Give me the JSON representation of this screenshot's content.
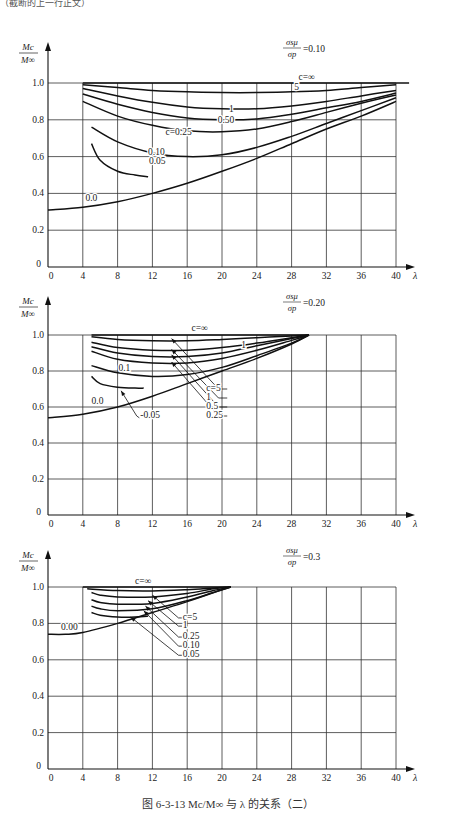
{
  "header_fragment": "（截断的上一行正文）",
  "caption": "图 6-3-13   Mc/M∞ 与 λ 的关系（二）",
  "chart_data": [
    {
      "type": "line",
      "title": "σs μ / σp = 0.10",
      "param_label": "σsμ/σp",
      "param_value": "=0.10",
      "xlabel": "λ",
      "ylabel": "Mc/M∞",
      "xlim": [
        0,
        40
      ],
      "ylim": [
        0,
        1.0
      ],
      "xticks": [
        0,
        4,
        8,
        12,
        16,
        20,
        24,
        28,
        32,
        36,
        40
      ],
      "yticks": [
        0,
        0.2,
        0.4,
        0.6,
        0.8,
        1.0
      ],
      "grid": true,
      "layout": {
        "x0": 48,
        "x40": 396,
        "y0": 267,
        "y1": 83,
        "axis_top": 42,
        "xaxis_end": 415
      },
      "series": [
        {
          "name": "c=∞",
          "x": [
            4,
            10,
            20,
            30,
            40,
            41.5
          ],
          "y": [
            1.0,
            1.0,
            1.0,
            1.0,
            1.0,
            1.0
          ]
        },
        {
          "name": "5",
          "x": [
            4,
            8,
            12,
            16,
            20,
            24,
            28,
            32,
            36,
            40
          ],
          "y": [
            0.99,
            0.975,
            0.96,
            0.952,
            0.948,
            0.948,
            0.952,
            0.96,
            0.975,
            0.99
          ]
        },
        {
          "name": "1",
          "x": [
            4,
            8,
            12,
            16,
            20,
            24,
            28,
            32,
            36,
            40
          ],
          "y": [
            0.97,
            0.93,
            0.895,
            0.87,
            0.86,
            0.86,
            0.875,
            0.9,
            0.93,
            0.96
          ]
        },
        {
          "name": "0.50",
          "x": [
            4,
            8,
            12,
            16,
            20,
            24,
            28,
            32,
            36,
            40
          ],
          "y": [
            0.94,
            0.885,
            0.84,
            0.81,
            0.8,
            0.805,
            0.83,
            0.865,
            0.9,
            0.945
          ]
        },
        {
          "name": "c=0.25",
          "x": [
            4,
            8,
            12,
            16,
            20,
            24,
            28,
            32,
            36,
            40
          ],
          "y": [
            0.9,
            0.82,
            0.77,
            0.74,
            0.735,
            0.75,
            0.79,
            0.84,
            0.89,
            0.935
          ]
        },
        {
          "name": "0.10",
          "x": [
            5,
            8,
            12,
            16,
            20,
            24,
            28,
            32,
            36,
            40
          ],
          "y": [
            0.76,
            0.68,
            0.62,
            0.6,
            0.61,
            0.65,
            0.71,
            0.78,
            0.85,
            0.92
          ]
        },
        {
          "name": "0.05",
          "x": [
            5,
            6,
            8,
            10,
            11.5
          ],
          "y": [
            0.67,
            0.58,
            0.52,
            0.5,
            0.49
          ]
        },
        {
          "name": "0.0",
          "x": [
            0,
            4,
            8,
            12,
            16,
            20,
            24,
            28,
            32,
            36,
            40
          ],
          "y": [
            0.31,
            0.325,
            0.355,
            0.4,
            0.455,
            0.52,
            0.59,
            0.67,
            0.75,
            0.82,
            0.9
          ]
        }
      ],
      "labels": [
        {
          "text": "c=∞",
          "x": 28.8,
          "y": 1.015
        },
        {
          "text": "5",
          "x": 28.3,
          "y": 0.96
        },
        {
          "text": "1",
          "x": 20.8,
          "y": 0.84
        },
        {
          "text": "0.50",
          "x": 19.5,
          "y": 0.78
        },
        {
          "text": "c=0.25",
          "x": 13.5,
          "y": 0.72
        },
        {
          "text": "0.10",
          "x": 11.5,
          "y": 0.61
        },
        {
          "text": "0.05",
          "x": 11.6,
          "y": 0.56
        },
        {
          "text": "0.0",
          "x": 4.3,
          "y": 0.36
        }
      ]
    },
    {
      "type": "line",
      "title": "σs μ / σp = 0.20",
      "param_label": "σsμ/σp",
      "param_value": "=0.20",
      "xlabel": "λ",
      "ylabel": "Mc/M∞",
      "xlim": [
        0,
        40
      ],
      "ylim": [
        0,
        1.0
      ],
      "xticks": [
        0,
        4,
        8,
        12,
        16,
        20,
        24,
        28,
        32,
        36,
        40
      ],
      "yticks": [
        0,
        0.2,
        0.4,
        0.6,
        0.8,
        1.0
      ],
      "grid": true,
      "layout": {
        "x0": 48,
        "x40": 396,
        "y0": 515,
        "y1": 335,
        "axis_top": 296,
        "xaxis_end": 415
      },
      "series": [
        {
          "name": "c=∞",
          "x": [
            5,
            10,
            20,
            30
          ],
          "y": [
            1.0,
            1.0,
            1.0,
            1.0
          ]
        },
        {
          "name": "c=5",
          "x": [
            5,
            8,
            12,
            16,
            20,
            24,
            28,
            30
          ],
          "y": [
            0.99,
            0.975,
            0.968,
            0.968,
            0.975,
            0.985,
            0.995,
            1.0
          ]
        },
        {
          "name": "1",
          "x": [
            5,
            8,
            12,
            16,
            20,
            24,
            28,
            30
          ],
          "y": [
            0.96,
            0.93,
            0.915,
            0.915,
            0.93,
            0.955,
            0.985,
            1.0
          ]
        },
        {
          "name": "0.5",
          "x": [
            5,
            8,
            12,
            16,
            20,
            24,
            28,
            30
          ],
          "y": [
            0.935,
            0.9,
            0.88,
            0.88,
            0.9,
            0.94,
            0.98,
            1.0
          ]
        },
        {
          "name": "0.25",
          "x": [
            5,
            8,
            12,
            16,
            20,
            24,
            28,
            30
          ],
          "y": [
            0.91,
            0.865,
            0.845,
            0.845,
            0.87,
            0.915,
            0.97,
            1.0
          ]
        },
        {
          "name": "0.1",
          "x": [
            5,
            8,
            12,
            16,
            20,
            24,
            28,
            30
          ],
          "y": [
            0.83,
            0.79,
            0.77,
            0.78,
            0.82,
            0.885,
            0.955,
            1.0
          ]
        },
        {
          "name": "0.05",
          "x": [
            5,
            6,
            8,
            10,
            11
          ],
          "y": [
            0.77,
            0.73,
            0.71,
            0.705,
            0.705
          ]
        },
        {
          "name": "0.0",
          "x": [
            0,
            4,
            8,
            12,
            16,
            20,
            24,
            28,
            30
          ],
          "y": [
            0.54,
            0.56,
            0.6,
            0.66,
            0.73,
            0.8,
            0.87,
            0.95,
            1.0
          ]
        }
      ],
      "labels": [
        {
          "text": "c=∞",
          "x": 16.5,
          "y": 1.02
        },
        {
          "text": "c=5",
          "x": 18.2,
          "y": 0.69
        },
        {
          "text": "1",
          "x": 18.2,
          "y": 0.64
        },
        {
          "text": "0.5",
          "x": 18.2,
          "y": 0.59
        },
        {
          "text": "0.25",
          "x": 18.2,
          "y": 0.54
        },
        {
          "text": "0.1",
          "x": 8.1,
          "y": 0.8
        },
        {
          "text": "-0.05",
          "x": 10.6,
          "y": 0.54
        },
        {
          "text": "0.0",
          "x": 5.0,
          "y": 0.615
        },
        {
          "text": "1",
          "x": 22.2,
          "y": 0.93
        }
      ],
      "arrows": [
        {
          "from": [
            19.6,
            0.7
          ],
          "to": [
            14.2,
            0.98
          ]
        },
        {
          "from": [
            19.6,
            0.65
          ],
          "to": [
            14.2,
            0.92
          ]
        },
        {
          "from": [
            19.6,
            0.6
          ],
          "to": [
            14.2,
            0.89
          ]
        },
        {
          "from": [
            19.6,
            0.55
          ],
          "to": [
            14.2,
            0.85
          ]
        },
        {
          "from": [
            10.2,
            0.55
          ],
          "to": [
            8.4,
            0.69
          ]
        }
      ],
      "leaders": [
        {
          "from": [
            19.6,
            0.7
          ],
          "to": [
            20.6,
            0.7
          ]
        },
        {
          "from": [
            19.6,
            0.65
          ],
          "to": [
            20.6,
            0.65
          ]
        },
        {
          "from": [
            19.6,
            0.6
          ],
          "to": [
            20.6,
            0.6
          ]
        },
        {
          "from": [
            19.6,
            0.55
          ],
          "to": [
            20.6,
            0.55
          ]
        },
        {
          "from": [
            10.2,
            0.55
          ],
          "to": [
            10.5,
            0.54
          ]
        }
      ]
    },
    {
      "type": "line",
      "title": "σs μ / σp = 0.3",
      "param_label": "σsμ/σp",
      "param_value": "=0.3",
      "xlabel": "λ",
      "ylabel": "Mc/M∞",
      "xlim": [
        0,
        40
      ],
      "ylim": [
        0,
        1.0
      ],
      "xticks": [
        0,
        4,
        8,
        12,
        16,
        20,
        24,
        28,
        32,
        36,
        40
      ],
      "yticks": [
        0,
        0.2,
        0.4,
        0.6,
        0.8,
        1.0
      ],
      "grid": true,
      "layout": {
        "x0": 48,
        "x40": 396,
        "y0": 769,
        "y1": 587,
        "axis_top": 550,
        "xaxis_end": 415
      },
      "series": [
        {
          "name": "c=∞",
          "x": [
            4,
            10,
            16,
            21
          ],
          "y": [
            1.0,
            1.0,
            1.0,
            1.0
          ]
        },
        {
          "name": "c=5",
          "x": [
            4.5,
            8,
            12,
            16,
            19,
            21
          ],
          "y": [
            0.99,
            0.98,
            0.978,
            0.985,
            0.995,
            1.0
          ]
        },
        {
          "name": "1",
          "x": [
            5,
            6,
            8,
            12,
            16,
            19,
            21
          ],
          "y": [
            0.97,
            0.955,
            0.945,
            0.945,
            0.965,
            0.99,
            1.0
          ]
        },
        {
          "name": "0.25",
          "x": [
            5,
            6,
            8,
            12,
            16,
            19,
            21
          ],
          "y": [
            0.93,
            0.915,
            0.905,
            0.91,
            0.945,
            0.98,
            1.0
          ]
        },
        {
          "name": "0.10",
          "x": [
            5,
            6,
            8,
            12,
            16,
            19,
            21
          ],
          "y": [
            0.895,
            0.88,
            0.87,
            0.88,
            0.925,
            0.97,
            1.0
          ]
        },
        {
          "name": "0.05",
          "x": [
            5,
            6,
            8,
            10,
            11.5
          ],
          "y": [
            0.86,
            0.845,
            0.835,
            0.835,
            0.84
          ]
        },
        {
          "name": "0.00",
          "x": [
            0,
            2,
            4,
            8,
            12,
            16,
            20,
            21
          ],
          "y": [
            0.74,
            0.74,
            0.75,
            0.8,
            0.86,
            0.92,
            0.985,
            1.0
          ]
        }
      ],
      "labels": [
        {
          "text": "c=∞",
          "x": 10.0,
          "y": 1.015
        },
        {
          "text": "c=5",
          "x": 15.5,
          "y": 0.82
        },
        {
          "text": "1",
          "x": 15.5,
          "y": 0.775
        },
        {
          "text": "0.25",
          "x": 15.5,
          "y": 0.715
        },
        {
          "text": "0.10",
          "x": 15.5,
          "y": 0.665
        },
        {
          "text": "0.05",
          "x": 15.5,
          "y": 0.615
        },
        {
          "text": "0.00",
          "x": 1.5,
          "y": 0.765
        }
      ],
      "arrows": [
        {
          "from": [
            15.0,
            0.83
          ],
          "to": [
            12.0,
            0.955
          ]
        },
        {
          "from": [
            15.0,
            0.785
          ],
          "to": [
            11.5,
            0.925
          ]
        },
        {
          "from": [
            15.0,
            0.725
          ],
          "to": [
            11.2,
            0.895
          ]
        },
        {
          "from": [
            15.0,
            0.675
          ],
          "to": [
            11.0,
            0.87
          ]
        },
        {
          "from": [
            15.0,
            0.625
          ],
          "to": [
            9.5,
            0.835
          ]
        }
      ],
      "leaders": [
        {
          "from": [
            15.0,
            0.83
          ],
          "to": [
            15.4,
            0.83
          ]
        },
        {
          "from": [
            15.0,
            0.785
          ],
          "to": [
            15.4,
            0.785
          ]
        },
        {
          "from": [
            15.0,
            0.725
          ],
          "to": [
            15.4,
            0.725
          ]
        },
        {
          "from": [
            15.0,
            0.675
          ],
          "to": [
            15.4,
            0.675
          ]
        },
        {
          "from": [
            15.0,
            0.625
          ],
          "to": [
            15.4,
            0.625
          ]
        }
      ]
    }
  ]
}
